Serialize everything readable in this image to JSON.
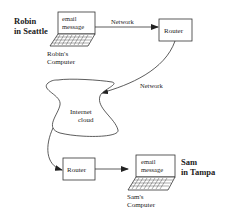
{
  "diagram": {
    "sender": {
      "name_line1": "Robin",
      "name_line2": "in Seattle",
      "screen_line1": "email",
      "screen_line2": "message",
      "computer_line1": "Robin's",
      "computer_line2": "Computer"
    },
    "receiver": {
      "name_line1": "Sam",
      "name_line2": "in Tampa",
      "screen_line1": "email",
      "screen_line2": "message",
      "computer_line1": "Sam's",
      "computer_line2": "Computer"
    },
    "router_top": {
      "label": "Router"
    },
    "router_bottom": {
      "label": "Router"
    },
    "link_top": {
      "label": "Network"
    },
    "link_right": {
      "label": "Network"
    },
    "cloud": {
      "line1": "Internet",
      "line2": "cloud"
    },
    "colors": {
      "stroke": "#333333",
      "text": "#222222",
      "background": "#ffffff"
    }
  }
}
